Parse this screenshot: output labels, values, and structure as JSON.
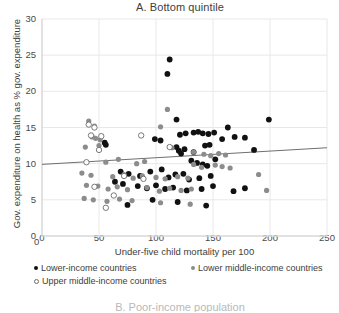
{
  "chart_data": {
    "type": "scatter",
    "title": "A. Bottom quintile",
    "xlabel": "Under-five child mortality per 100",
    "ylabel": "Gov. expenditure on health as % gov. expenditure",
    "xlim": [
      0,
      250
    ],
    "ylim": [
      0,
      30
    ],
    "xticks": [
      0,
      50,
      100,
      150,
      200,
      250
    ],
    "yticks": [
      0,
      5,
      10,
      15,
      20,
      25,
      30
    ],
    "grid": true,
    "legend_position": "below-axis",
    "colors": {
      "lower_income": "#111111",
      "lower_middle_income": "#8c8c8c",
      "upper_middle_income": "#ffffff",
      "upper_middle_income_edge": "#6b6b6b",
      "trendline": "#6f6f6f",
      "gridline": "#e8e8e8",
      "axis": "#d0d0d0"
    },
    "trendline": {
      "x": [
        0,
        250
      ],
      "y": [
        9.9,
        12.2
      ]
    },
    "series": [
      {
        "name": "Lower-income countries",
        "marker": "filled-black",
        "points": [
          [
            112,
            24.4
          ],
          [
            110,
            22.4
          ],
          [
            118,
            16.1
          ],
          [
            199,
            16.1
          ],
          [
            55,
            12.9
          ],
          [
            56,
            12.6
          ],
          [
            99,
            13.4
          ],
          [
            104,
            13.2
          ],
          [
            121,
            14.0
          ],
          [
            126,
            14.2
          ],
          [
            133,
            14.3
          ],
          [
            137,
            14.4
          ],
          [
            141,
            14.2
          ],
          [
            146,
            14.1
          ],
          [
            151,
            14.3
          ],
          [
            158,
            13.4
          ],
          [
            169,
            13.7
          ],
          [
            178,
            13.6
          ],
          [
            163,
            15.0
          ],
          [
            118,
            12.3
          ],
          [
            120,
            11.8
          ],
          [
            122,
            11.4
          ],
          [
            125,
            12.0
          ],
          [
            133,
            11.6
          ],
          [
            143,
            12.5
          ],
          [
            147,
            12.6
          ],
          [
            186,
            11.9
          ],
          [
            131,
            10.4
          ],
          [
            136,
            10.1
          ],
          [
            141,
            9.9
          ],
          [
            145,
            9.7
          ],
          [
            152,
            10.6
          ],
          [
            69,
            8.9
          ],
          [
            76,
            8.6
          ],
          [
            86,
            8.3
          ],
          [
            95,
            8.9
          ],
          [
            105,
            9.2
          ],
          [
            111,
            8.1
          ],
          [
            117,
            8.5
          ],
          [
            124,
            8.6
          ],
          [
            129,
            7.8
          ],
          [
            138,
            8.0
          ],
          [
            148,
            8.3
          ],
          [
            64,
            7.5
          ],
          [
            71,
            7.2
          ],
          [
            84,
            6.9
          ],
          [
            92,
            6.6
          ],
          [
            100,
            7.0
          ],
          [
            108,
            6.5
          ],
          [
            115,
            6.7
          ],
          [
            127,
            6.3
          ],
          [
            140,
            6.5
          ],
          [
            150,
            6.9
          ],
          [
            168,
            6.2
          ],
          [
            178,
            6.6
          ],
          [
            75,
            4.3
          ],
          [
            97,
            5.0
          ],
          [
            119,
            4.7
          ],
          [
            144,
            4.2
          ]
        ]
      },
      {
        "name": "Lower middle-income countries",
        "marker": "filled-gray",
        "points": [
          [
            110,
            17.5
          ],
          [
            41,
            15.9
          ],
          [
            46,
            15.2
          ],
          [
            104,
            15.1
          ],
          [
            44,
            13.7
          ],
          [
            47,
            13.5
          ],
          [
            51,
            13.3
          ],
          [
            38,
            12.3
          ],
          [
            50,
            12.5
          ],
          [
            114,
            12.2
          ],
          [
            133,
            11.6
          ],
          [
            142,
            11.3
          ],
          [
            148,
            11.1
          ],
          [
            155,
            11.4
          ],
          [
            161,
            11.2
          ],
          [
            56,
            10.2
          ],
          [
            67,
            10.6
          ],
          [
            83,
            10.0
          ],
          [
            90,
            10.3
          ],
          [
            133,
            9.9
          ],
          [
            140,
            9.5
          ],
          [
            152,
            9.8
          ],
          [
            158,
            9.6
          ],
          [
            165,
            9.4
          ],
          [
            35,
            8.7
          ],
          [
            43,
            8.4
          ],
          [
            62,
            8.2
          ],
          [
            72,
            8.5
          ],
          [
            80,
            8.0
          ],
          [
            88,
            8.3
          ],
          [
            100,
            8.1
          ],
          [
            108,
            7.9
          ],
          [
            119,
            8.2
          ],
          [
            128,
            8.0
          ],
          [
            190,
            8.5
          ],
          [
            39,
            7.0
          ],
          [
            49,
            6.9
          ],
          [
            58,
            6.5
          ],
          [
            66,
            6.8
          ],
          [
            75,
            6.4
          ],
          [
            92,
            6.7
          ],
          [
            103,
            6.2
          ],
          [
            112,
            6.6
          ],
          [
            122,
            6.3
          ],
          [
            131,
            6.5
          ],
          [
            197,
            6.3
          ],
          [
            37,
            5.2
          ],
          [
            45,
            5.0
          ],
          [
            57,
            4.8
          ],
          [
            68,
            5.1
          ],
          [
            79,
            4.9
          ],
          [
            104,
            4.6
          ],
          [
            130,
            4.4
          ]
        ]
      },
      {
        "name": "Upper middle-income countries",
        "marker": "open-circle",
        "points": [
          [
            41,
            15.4
          ],
          [
            46,
            15.0
          ],
          [
            43,
            13.9
          ],
          [
            52,
            13.8
          ],
          [
            50,
            11.9
          ],
          [
            87,
            13.9
          ],
          [
            112,
            12.3
          ],
          [
            39,
            10.2
          ],
          [
            72,
            8.3
          ],
          [
            46,
            6.8
          ],
          [
            63,
            5.6
          ],
          [
            89,
            7.9
          ],
          [
            56,
            3.9
          ]
        ]
      }
    ]
  },
  "next_panel": {
    "title": "B. Poor-income population"
  }
}
